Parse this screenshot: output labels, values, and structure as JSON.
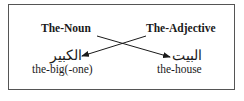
{
  "headers": {
    "left": "The-Noun",
    "right": "The-Adjective"
  },
  "words": {
    "left_arabic": "الكبير",
    "left_gloss": "the-big(-one)",
    "right_arabic": "البيت",
    "right_gloss": "the-house"
  },
  "colors": {
    "ink": "#1a1a1a",
    "border": "#555555"
  }
}
